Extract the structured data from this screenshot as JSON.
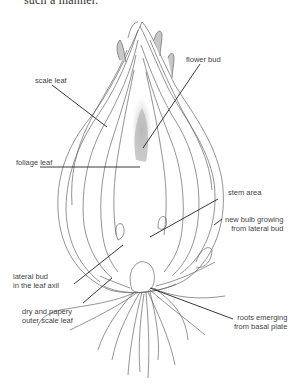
{
  "cut_text": "such a manner.",
  "diagram": {
    "labels": [
      {
        "id": "scale-leaf",
        "lines": [
          "scale leaf"
        ]
      },
      {
        "id": "flower-bud",
        "lines": [
          "flower bud"
        ]
      },
      {
        "id": "foliage-leaf",
        "lines": [
          "foliage leaf"
        ]
      },
      {
        "id": "stem-area",
        "lines": [
          "stem area"
        ]
      },
      {
        "id": "new-bulb",
        "lines": [
          "new bulb growing",
          "from lateral bud"
        ]
      },
      {
        "id": "lateral-bud",
        "lines": [
          "lateral bud",
          "in the leaf axil"
        ]
      },
      {
        "id": "dry-outer",
        "lines": [
          "dry and papery",
          "outer scale leaf"
        ]
      },
      {
        "id": "roots",
        "lines": [
          "roots emerging",
          "from basal plate"
        ]
      }
    ],
    "colors": {
      "line": "#555555",
      "leader": "#222222",
      "shade": "#b8b8b8"
    }
  }
}
